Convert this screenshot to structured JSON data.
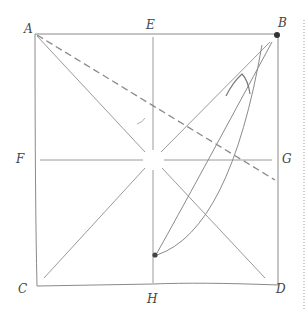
{
  "diagram": {
    "labels": {
      "A": "A",
      "B": "B",
      "C": "C",
      "D": "D",
      "E": "E",
      "F": "F",
      "G": "G",
      "H": "H"
    },
    "square": {
      "x1": 35,
      "y1": 34,
      "x2": 278,
      "y2": 285
    },
    "points": {
      "A": [
        35,
        34
      ],
      "B": [
        278,
        34
      ],
      "C": [
        35,
        285
      ],
      "D": [
        278,
        285
      ],
      "E": [
        153,
        34
      ],
      "F": [
        35,
        160
      ],
      "G": [
        278,
        160
      ],
      "H": [
        153,
        285
      ],
      "center": [
        153,
        160
      ],
      "dot_B": [
        277,
        35
      ],
      "dot_H_inner": [
        155,
        255
      ]
    },
    "colors": {
      "line": "#8a8a8a",
      "dot": "#333333",
      "border_dotted": "#999999"
    }
  }
}
